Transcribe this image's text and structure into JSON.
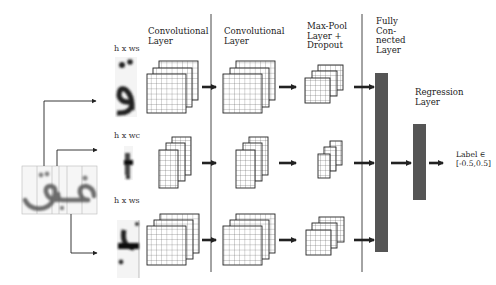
{
  "diagram": {
    "input": {
      "name": "input-word-image",
      "glyph": "غبق",
      "grid_columns": 5
    },
    "branches": [
      {
        "id": "top",
        "dim_label": "h x ws",
        "slice_glyph": "ق",
        "width_type": "wide"
      },
      {
        "id": "middle",
        "dim_label": "h x wc",
        "slice_glyph": "ب",
        "width_type": "narrow"
      },
      {
        "id": "bottom",
        "dim_label": "h x ws",
        "slice_glyph": "غ",
        "width_type": "wide"
      }
    ],
    "columns": [
      {
        "id": "conv1",
        "label_lines": [
          "Convolutional",
          "Layer"
        ]
      },
      {
        "id": "conv2",
        "label_lines": [
          "Convolutional",
          "Layer"
        ]
      },
      {
        "id": "maxpool",
        "label_lines": [
          "Max-Pool",
          "Layer +",
          "Dropout"
        ]
      },
      {
        "id": "fc",
        "label_lines": [
          "Fully",
          "Con-",
          "nected",
          "Layer"
        ]
      },
      {
        "id": "regression",
        "label_lines": [
          "Regression",
          "Layer"
        ]
      }
    ],
    "output": {
      "label_line1": "Label ∈",
      "label_line2": "[-0.5,0.5]"
    },
    "colors": {
      "layer_bar": "#555555",
      "lines": "#222222",
      "grid": "#333333",
      "input_grid": "#bbbbbb",
      "glyph": "#444444"
    }
  }
}
